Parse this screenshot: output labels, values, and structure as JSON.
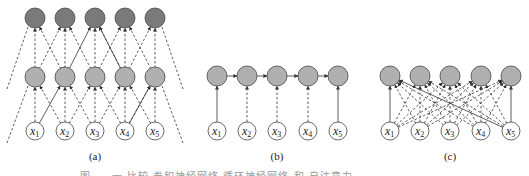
{
  "figure": {
    "colors": {
      "dark_node": "#7a7a7a",
      "mid_node": "#b0b0b0",
      "input_node": "#ffffff",
      "edge": "#333333"
    },
    "panels": [
      {
        "id": "a",
        "label": "(a)",
        "inputs": [
          "x1",
          "x2",
          "x3",
          "x4",
          "x5"
        ],
        "description": "two stacked layers, each node receives dashed edges from 3 neighbors below; one solid diagonal path"
      },
      {
        "id": "b",
        "label": "(b)",
        "inputs": [
          "x1",
          "x2",
          "x3",
          "x4",
          "x5"
        ],
        "description": "chain of hidden nodes connected left-to-right; each input feeds one node"
      },
      {
        "id": "c",
        "label": "(c)",
        "inputs": [
          "x1",
          "x2",
          "x3",
          "x4",
          "x5"
        ],
        "description": "single layer; each node receives dashed edges from all inputs; solid edges x1->h1, x5->h5, x5->h1"
      }
    ],
    "input_labels": [
      {
        "base": "x",
        "sub": "1"
      },
      {
        "base": "x",
        "sub": "2"
      },
      {
        "base": "x",
        "sub": "3"
      },
      {
        "base": "x",
        "sub": "4"
      },
      {
        "base": "x",
        "sub": "5"
      }
    ],
    "caption": "图 . . 一 比较 卷积神经网络 循环神经网络 和 自注意力"
  }
}
